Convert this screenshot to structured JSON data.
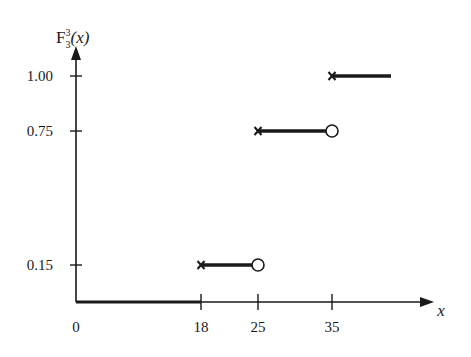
{
  "chart_data": {
    "type": "line",
    "subtype": "step-cdf",
    "title": "",
    "ylabel": "F",
    "ylabel_sup": "3",
    "ylabel_sub": "3",
    "ylabel_arg": "(x)",
    "xlabel": "x",
    "xlim": [
      0,
      45
    ],
    "ylim": [
      0,
      1.0
    ],
    "grid": false,
    "legend": null,
    "x_ticks": [
      {
        "value": 0,
        "label": "0",
        "tick": false
      },
      {
        "value": 18,
        "label": "18",
        "tick": true
      },
      {
        "value": 25,
        "label": "25",
        "tick": true
      },
      {
        "value": 35,
        "label": "35",
        "tick": true
      }
    ],
    "y_ticks": [
      {
        "value": 0.15,
        "label": "0.15"
      },
      {
        "value": 0.75,
        "label": "0.75"
      },
      {
        "value": 1.0,
        "label": "1.00"
      }
    ],
    "segments": [
      {
        "x_start": 0,
        "x_end": 18,
        "y": 0,
        "start_marker": "none",
        "end_marker": "none"
      },
      {
        "x_start": 18,
        "x_end": 25,
        "y": 0.15,
        "start_marker": "cross",
        "end_marker": "open-circle"
      },
      {
        "x_start": 25,
        "x_end": 35,
        "y": 0.75,
        "start_marker": "cross",
        "end_marker": "open-circle"
      },
      {
        "x_start": 35,
        "x_end": 44,
        "y": 1.0,
        "start_marker": "cross",
        "end_marker": "none"
      }
    ],
    "colors": {
      "ink": "#1a1a1a",
      "background": "#ffffff"
    }
  }
}
